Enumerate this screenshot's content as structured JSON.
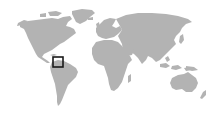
{
  "map": {
    "type": "world-locator-map",
    "background_color": "#ffffff",
    "land_color": "#b3b3b3",
    "marker": {
      "shape": "square",
      "color": "#1a1a1a",
      "region_hint": "northern South America / Caribbean",
      "x": 53,
      "y": 57,
      "width": 10,
      "height": 10
    }
  }
}
